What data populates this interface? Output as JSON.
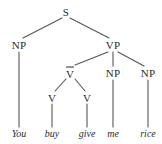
{
  "diagram": {
    "type": "constituency-parse-tree",
    "sentence": "You buy give me rice",
    "colors": {
      "background": "#ffffff",
      "line": "#555555",
      "text": "#2b2b2b"
    },
    "nodes": [
      {
        "id": "s",
        "label": "S",
        "overbar": false,
        "x": 66,
        "y": 12
      },
      {
        "id": "np1",
        "label": "NP",
        "overbar": false,
        "x": 19,
        "y": 45
      },
      {
        "id": "vp",
        "label": "VP",
        "overbar": false,
        "x": 113,
        "y": 45
      },
      {
        "id": "vbar",
        "label": "V",
        "overbar": true,
        "x": 70,
        "y": 73
      },
      {
        "id": "np2",
        "label": "NP",
        "overbar": false,
        "x": 113,
        "y": 73
      },
      {
        "id": "np3",
        "label": "NP",
        "overbar": false,
        "x": 148,
        "y": 73
      },
      {
        "id": "v1",
        "label": "V",
        "overbar": false,
        "x": 52,
        "y": 98
      },
      {
        "id": "v2",
        "label": "V",
        "overbar": false,
        "x": 87,
        "y": 98
      }
    ],
    "leaves": [
      {
        "id": "w1",
        "label": "You",
        "x": 19,
        "y": 134,
        "parent": "np1"
      },
      {
        "id": "w2",
        "label": "buy",
        "x": 52,
        "y": 134,
        "parent": "v1"
      },
      {
        "id": "w3",
        "label": "give",
        "x": 87,
        "y": 134,
        "parent": "v2"
      },
      {
        "id": "w4",
        "label": "me",
        "x": 113,
        "y": 134,
        "parent": "np2"
      },
      {
        "id": "w5",
        "label": "rice",
        "x": 148,
        "y": 134,
        "parent": "np3"
      }
    ],
    "edges": [
      {
        "from": "s",
        "to": "np1",
        "x1": 62,
        "y1": 18,
        "x2": 23,
        "y2": 38
      },
      {
        "from": "s",
        "to": "vp",
        "x1": 70,
        "y1": 18,
        "x2": 109,
        "y2": 38
      },
      {
        "from": "np1",
        "to": "w1",
        "x1": 19,
        "y1": 52,
        "x2": 19,
        "y2": 127
      },
      {
        "from": "vp",
        "to": "vbar",
        "x1": 108,
        "y1": 52,
        "x2": 75,
        "y2": 65
      },
      {
        "from": "vp",
        "to": "np2",
        "x1": 113,
        "y1": 52,
        "x2": 113,
        "y2": 66
      },
      {
        "from": "vp",
        "to": "np3",
        "x1": 118,
        "y1": 52,
        "x2": 144,
        "y2": 66
      },
      {
        "from": "vbar",
        "to": "v1",
        "x1": 66,
        "y1": 79,
        "x2": 55,
        "y2": 91
      },
      {
        "from": "vbar",
        "to": "v2",
        "x1": 75,
        "y1": 79,
        "x2": 85,
        "y2": 91
      },
      {
        "from": "v1",
        "to": "w2",
        "x1": 52,
        "y1": 104,
        "x2": 52,
        "y2": 127
      },
      {
        "from": "v2",
        "to": "w3",
        "x1": 87,
        "y1": 104,
        "x2": 87,
        "y2": 127
      },
      {
        "from": "np2",
        "to": "w4",
        "x1": 113,
        "y1": 80,
        "x2": 113,
        "y2": 127
      },
      {
        "from": "np3",
        "to": "w5",
        "x1": 148,
        "y1": 80,
        "x2": 148,
        "y2": 127
      }
    ]
  }
}
